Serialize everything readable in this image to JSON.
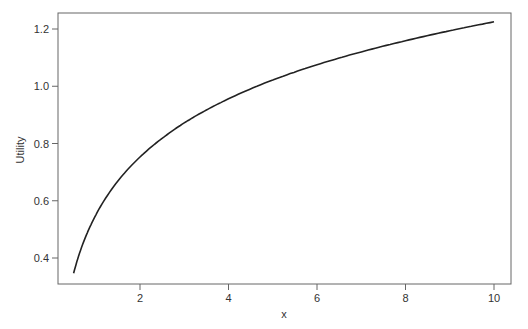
{
  "chart_data": {
    "type": "line",
    "title": "",
    "xlabel": "x",
    "ylabel": "Utility",
    "xlim": [
      0.25,
      10.4
    ],
    "ylim": [
      0.31,
      1.26
    ],
    "xticks": [
      2,
      4,
      6,
      8,
      10
    ],
    "yticks": [
      0.4,
      0.6,
      0.8,
      1.0,
      1.2
    ],
    "xtick_labels": [
      "2",
      "4",
      "6",
      "8",
      "10"
    ],
    "ytick_labels": [
      "0.4",
      "0.6",
      "0.8",
      "1.0",
      "1.2"
    ],
    "grid": false,
    "legend": null,
    "series": [
      {
        "name": "Utility",
        "color": "#222222",
        "x": [
          0.5,
          0.75,
          1,
          1.5,
          2,
          2.5,
          3,
          3.5,
          4,
          5,
          6,
          7,
          8,
          9,
          10
        ],
        "y": [
          0.347,
          0.466,
          0.55,
          0.669,
          0.753,
          0.818,
          0.872,
          0.917,
          0.956,
          1.022,
          1.075,
          1.12,
          1.159,
          1.194,
          1.225
        ]
      }
    ]
  }
}
